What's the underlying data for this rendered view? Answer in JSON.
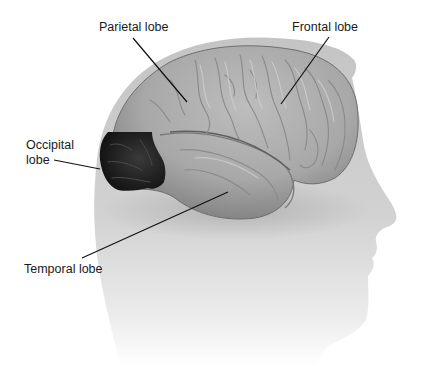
{
  "diagram": {
    "highlighted_region": "occipital-lobe",
    "labels": [
      {
        "id": "parietal",
        "text": "Parietal lobe"
      },
      {
        "id": "frontal",
        "text": "Frontal lobe"
      },
      {
        "id": "occipital",
        "text": "Occipital\nlobe"
      },
      {
        "id": "temporal",
        "text": "Temporal lobe"
      }
    ],
    "colors": {
      "background": "#ffffff",
      "head_silhouette": "#c8c8c8",
      "brain": "#a9a9a9",
      "occipital_highlight": "#1f1f1f",
      "leader_lines": "#111111",
      "label_text": "#1a1a1a"
    }
  }
}
